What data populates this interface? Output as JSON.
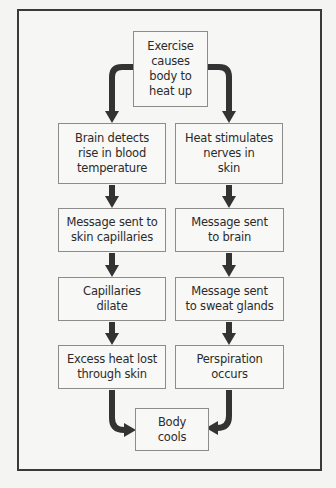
{
  "diagram": {
    "type": "flowchart",
    "colors": {
      "background": "#f4f4f2",
      "frame_border": "#3a3a3a",
      "box_border": "#8c8c8c",
      "box_fill": "#f8f8f6",
      "arrow": "#333333",
      "text": "#2b2b2b"
    },
    "start": {
      "label": "Exercise\ncauses\nbody to\nheat up"
    },
    "left_branch": [
      {
        "label": "Brain detects\nrise in blood\ntemperature"
      },
      {
        "label": "Message sent to\nskin capillaries"
      },
      {
        "label": "Capillaries\ndilate"
      },
      {
        "label": "Excess heat lost\nthrough skin"
      }
    ],
    "right_branch": [
      {
        "label": "Heat stimulates\nnerves in\nskin"
      },
      {
        "label": "Message sent\nto brain"
      },
      {
        "label": "Message sent\nto sweat glands"
      },
      {
        "label": "Perspiration\noccurs"
      }
    ],
    "end": {
      "label": "Body\ncools"
    }
  }
}
